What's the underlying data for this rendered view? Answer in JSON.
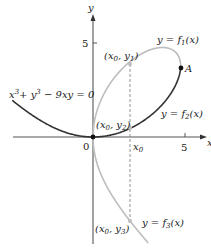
{
  "figure": {
    "equation_label": "x³ + y³ − 9xy = 0",
    "equation": {
      "a": "x",
      "b": "+ y",
      "c": " − 9xy = 0",
      "exp": "3"
    },
    "axes": {
      "x_label": "x",
      "y_label": "y",
      "origin_label": "0",
      "x_tick_label": "5",
      "y_tick_label": "5",
      "x0_label": "x",
      "x0_sub": "0"
    },
    "branches": [
      {
        "name": "f1",
        "label_pre": "y = f",
        "label_sub": "1",
        "label_post": "(x)",
        "color": "#bdbdbd"
      },
      {
        "name": "f2",
        "label_pre": "y = f",
        "label_sub": "2",
        "label_post": "(x)",
        "color": "#333333"
      },
      {
        "name": "f3",
        "label_pre": "y = f",
        "label_sub": "3",
        "label_post": "(x)",
        "color": "#bdbdbd"
      }
    ],
    "points": [
      {
        "name": "x0-y1",
        "label_pre": "(x",
        "s1": "0",
        "mid": ", y",
        "s2": "1",
        "post": ")"
      },
      {
        "name": "x0-y2",
        "label_pre": "(x",
        "s1": "0",
        "mid": ", y",
        "s2": "2",
        "post": ")"
      },
      {
        "name": "x0-y3",
        "label_pre": "(x",
        "s1": "0",
        "mid": ", y",
        "s2": "3",
        "post": ")"
      },
      {
        "name": "A",
        "label": "A"
      }
    ],
    "colors": {
      "axis": "#555555",
      "dark_curve": "#333333",
      "light_curve": "#bdbdbd",
      "dashed": "#888888"
    }
  }
}
